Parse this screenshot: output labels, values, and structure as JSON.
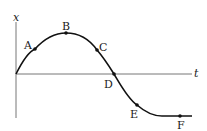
{
  "diagram": {
    "title": "",
    "axes": {
      "vertical_label": "x",
      "horizontal_label": "t"
    },
    "points": [
      {
        "id": "A",
        "label": "A",
        "x": 35,
        "y": 49
      },
      {
        "id": "B",
        "label": "B",
        "x": 66,
        "y": 33
      },
      {
        "id": "C",
        "label": "C",
        "x": 97,
        "y": 50
      },
      {
        "id": "D",
        "label": "D",
        "x": 114,
        "y": 74
      },
      {
        "id": "E",
        "label": "E",
        "x": 137,
        "y": 105
      },
      {
        "id": "F",
        "label": "F",
        "x": 180,
        "y": 116
      }
    ],
    "colors": {
      "axis": "#777777",
      "curve": "#111111",
      "point": "#111111",
      "text": "#1a1a1a"
    }
  }
}
